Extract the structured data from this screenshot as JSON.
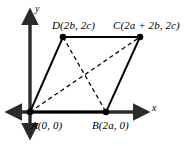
{
  "figure": {
    "width": 195,
    "height": 146,
    "background_color": "#ffffff",
    "line_color": "#000000",
    "axis_color": "#2b2b2b"
  },
  "axes": {
    "x_label": "x",
    "y_label": "y",
    "x_axis": {
      "y": 112,
      "x_start": 5,
      "x_end": 150,
      "arrows": "both"
    },
    "y_axis": {
      "x": 30,
      "y_start": 8,
      "y_end": 140,
      "arrows": "both"
    }
  },
  "vertices": [
    {
      "id": "A",
      "label": "A(0, 0)",
      "x": 30,
      "y": 112
    },
    {
      "id": "B",
      "label": "B(2a, 0)",
      "x": 106,
      "y": 112
    },
    {
      "id": "C",
      "label": "C(2a + 2b, 2c)",
      "x": 140,
      "y": 37
    },
    {
      "id": "D",
      "label": "D(2b, 2c)",
      "x": 63,
      "y": 37
    }
  ],
  "edges": [
    {
      "from": "A",
      "to": "B",
      "style": "solid"
    },
    {
      "from": "B",
      "to": "C",
      "style": "solid"
    },
    {
      "from": "C",
      "to": "D",
      "style": "solid"
    },
    {
      "from": "D",
      "to": "A",
      "style": "solid"
    }
  ],
  "diagonals": [
    {
      "from": "A",
      "to": "C",
      "style": "dashed"
    },
    {
      "from": "D",
      "to": "B",
      "style": "dashed"
    }
  ]
}
